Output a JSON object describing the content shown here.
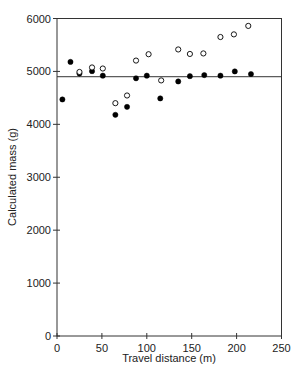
{
  "chart_data": {
    "type": "scatter",
    "title": "",
    "xlabel": "Travel distance (m)",
    "ylabel": "Calculated mass (g)",
    "xlim": [
      0,
      250
    ],
    "ylim": [
      0,
      6000
    ],
    "xticks": [
      0,
      50,
      100,
      150,
      200,
      250
    ],
    "yticks": [
      0,
      1000,
      2000,
      3000,
      4000,
      5000,
      6000
    ],
    "grid": false,
    "legend": null,
    "frame": "box",
    "reference_line": {
      "orientation": "horizontal",
      "y": 4900
    },
    "series": [
      {
        "name": "filled",
        "marker": "filled-circle",
        "color": "#000000",
        "points": [
          [
            6,
            4470
          ],
          [
            15,
            5180
          ],
          [
            25,
            4960
          ],
          [
            39,
            5005
          ],
          [
            51,
            4920
          ],
          [
            65,
            4180
          ],
          [
            78,
            4330
          ],
          [
            88,
            4870
          ],
          [
            100,
            4920
          ],
          [
            115,
            4490
          ],
          [
            135,
            4810
          ],
          [
            148,
            4910
          ],
          [
            164,
            4930
          ],
          [
            182,
            4920
          ],
          [
            198,
            5000
          ],
          [
            216,
            4950
          ]
        ]
      },
      {
        "name": "open",
        "marker": "open-circle",
        "color": "#000000",
        "points": [
          [
            25,
            4990
          ],
          [
            39,
            5075
          ],
          [
            51,
            5055
          ],
          [
            65,
            4400
          ],
          [
            78,
            4545
          ],
          [
            88,
            5205
          ],
          [
            102,
            5325
          ],
          [
            116,
            4830
          ],
          [
            135,
            5415
          ],
          [
            148,
            5330
          ],
          [
            163,
            5340
          ],
          [
            182,
            5650
          ],
          [
            197,
            5700
          ],
          [
            213,
            5860
          ]
        ]
      }
    ]
  }
}
